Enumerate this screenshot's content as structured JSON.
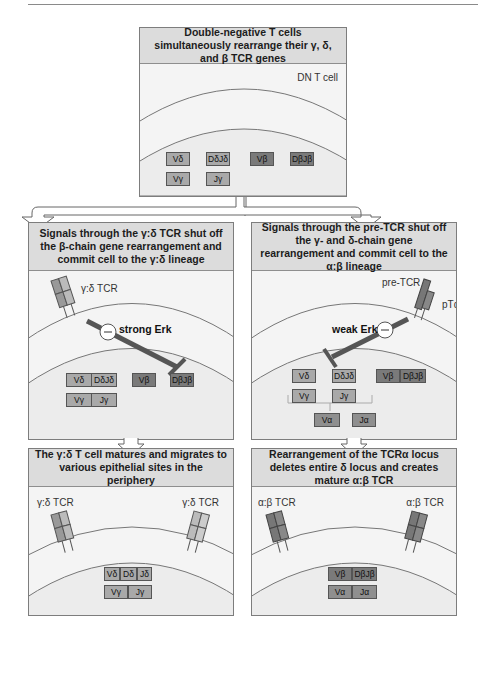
{
  "figure": {
    "panels": {
      "top": {
        "title": "Double-negative T cells simultaneously rearrange their γ, δ, and β TCR genes",
        "cell_label": "DN T cell",
        "genes": {
          "row1": [
            {
              "label": "Vδ"
            },
            {
              "label": "DδJδ"
            },
            {
              "label": "Vβ"
            },
            {
              "label": "DβJβ"
            }
          ],
          "row2": [
            {
              "label": "Vγ"
            },
            {
              "label": "Jγ"
            }
          ]
        }
      },
      "middle_left": {
        "title": "Signals through the γ:δ TCR shut off the β-chain gene rearrangement and commit cell to the γ:δ lineage",
        "receptor_label": "γ:δ TCR",
        "signal_label": "strong Erk",
        "inhibit_symbol": "−",
        "genes": {
          "row1": [
            {
              "label": "Vδ"
            },
            {
              "label": "DδJδ"
            },
            {
              "label": "Vβ"
            },
            {
              "label": "DβJβ"
            }
          ],
          "row2": [
            {
              "label": "Vγ"
            },
            {
              "label": "Jγ"
            }
          ]
        }
      },
      "middle_right": {
        "title": "Signals through the pre-TCR shut off the γ- and δ-chain gene rearrangement and commit cell to the α:β lineage",
        "receptor_label": "pre-TCR",
        "receptor_sub_label": "pTα",
        "signal_label": "weak Erk",
        "inhibit_symbol": "−",
        "genes": {
          "row1": [
            {
              "label": "Vδ"
            },
            {
              "label": "DδJδ"
            },
            {
              "label": "Vβ"
            },
            {
              "label": "DβJβ"
            }
          ],
          "row2": [
            {
              "label": "Vγ"
            },
            {
              "label": "Jγ"
            }
          ],
          "row3": [
            {
              "label": "Vα"
            },
            {
              "label": "Jα"
            }
          ]
        }
      },
      "bottom_left": {
        "title": "The γ:δ T cell matures and migrates to various epithelial sites in the periphery",
        "receptor_label_left": "γ:δ TCR",
        "receptor_label_right": "γ:δ TCR",
        "genes": {
          "row1": [
            {
              "label": "Vδ"
            },
            {
              "label": "Dδ"
            },
            {
              "label": "Jδ"
            }
          ],
          "row2": [
            {
              "label": "Vγ"
            },
            {
              "label": "Jγ"
            }
          ]
        }
      },
      "bottom_right": {
        "title": "Rearrangement of the TCRα locus deletes entire δ locus and creates mature α:β TCR",
        "receptor_label_left": "α:β TCR",
        "receptor_label_right": "α:β TCR",
        "genes": {
          "row1": [
            {
              "label": "Vβ"
            },
            {
              "label": "DβJβ"
            }
          ],
          "row2": [
            {
              "label": "Vα"
            },
            {
              "label": "Jα"
            }
          ]
        }
      }
    },
    "colors": {
      "header_bg": "#dcdcdc",
      "panel_bg": "#f4f4f4",
      "gamma_delta_gene": "#a9a9a9",
      "beta_gene": "#7a7a7a",
      "alpha_gene": "#8f8f8f"
    }
  }
}
